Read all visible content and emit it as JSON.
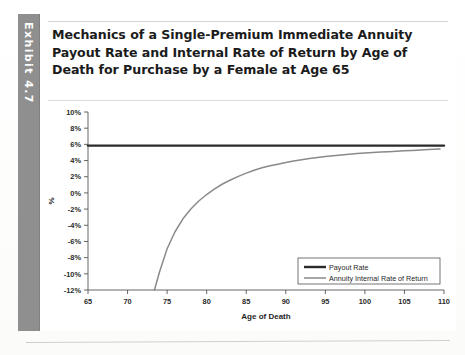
{
  "exhibit": {
    "label": "Exhibit 4.7"
  },
  "title": "Mechanics of a Single-Premium Immediate Annuity Payout Rate and Internal Rate of Return by Age of Death for Purchase by a Female at Age 65",
  "chart_data": {
    "type": "line",
    "title": "",
    "xlabel": "Age of Death",
    "ylabel": "%",
    "xlim": [
      65,
      110
    ],
    "ylim": [
      -12,
      10
    ],
    "xticks": [
      65,
      70,
      75,
      80,
      85,
      90,
      95,
      100,
      105,
      110
    ],
    "xtick_labels": [
      "65",
      "70",
      "75",
      "80",
      "85",
      "90",
      "95",
      "100",
      "105",
      "110"
    ],
    "yticks": [
      10,
      8,
      6,
      4,
      2,
      0,
      -2,
      -4,
      -6,
      -8,
      -10,
      -12
    ],
    "ytick_labels": [
      "10%",
      "8%",
      "6%",
      "4%",
      "2%",
      "0%",
      "-2%",
      "-4%",
      "-6%",
      "-8%",
      "-10%",
      "-12%"
    ],
    "grid": false,
    "legend_position": "bottom-right",
    "series": [
      {
        "name": "Payout Rate",
        "color": "#2b2b2b",
        "width": 2.4,
        "x": [
          65,
          110
        ],
        "values": [
          5.85,
          5.85
        ]
      },
      {
        "name": "Annuity Internal Rate of Return",
        "color": "#8a8a8a",
        "width": 1.5,
        "x": [
          73.4,
          74,
          75,
          76,
          77,
          78,
          79,
          80,
          81,
          82,
          83,
          84,
          85,
          86,
          87,
          88,
          89,
          90,
          91,
          92,
          93,
          94,
          95,
          96,
          97,
          98,
          99,
          100,
          101,
          102,
          103,
          104,
          105,
          106,
          107,
          108,
          109.5
        ],
        "values": [
          -12.0,
          -9.9,
          -6.9,
          -4.8,
          -3.2,
          -2.0,
          -1.0,
          -0.2,
          0.5,
          1.1,
          1.6,
          2.05,
          2.45,
          2.8,
          3.1,
          3.35,
          3.55,
          3.75,
          3.95,
          4.1,
          4.25,
          4.38,
          4.5,
          4.6,
          4.7,
          4.78,
          4.86,
          4.93,
          4.99,
          5.05,
          5.1,
          5.15,
          5.2,
          5.25,
          5.3,
          5.35,
          5.42
        ]
      }
    ]
  }
}
